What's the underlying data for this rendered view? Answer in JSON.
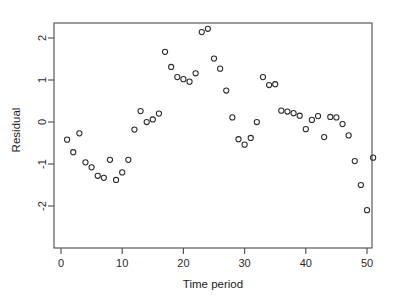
{
  "chart_data": {
    "type": "scatter",
    "title": "",
    "xlabel": "Time period",
    "ylabel": "Residual",
    "xlim": [
      -1.2,
      53.5
    ],
    "ylim": [
      -2.45,
      2.45
    ],
    "xticks": [
      0,
      10,
      20,
      30,
      40,
      50
    ],
    "yticks": [
      -2,
      -1,
      0,
      1,
      2
    ],
    "xtick_labels": [
      "0",
      "10",
      "20",
      "30",
      "40",
      "50"
    ],
    "ytick_labels": [
      "-2",
      "-1",
      "0",
      "1",
      "2"
    ],
    "grid": false,
    "legend": null,
    "marker": "open-circle",
    "marker_color": "#2b2b2b",
    "x": [
      1,
      2,
      3,
      4,
      5,
      6,
      7,
      8,
      9,
      10,
      11,
      12,
      13,
      14,
      15,
      16,
      17,
      18,
      19,
      20,
      21,
      22,
      23,
      24,
      25,
      26,
      27,
      28,
      29,
      30,
      31,
      32,
      33,
      34,
      35,
      36,
      37,
      38,
      39,
      40,
      41,
      42,
      43,
      44,
      45,
      46,
      47,
      48,
      49,
      50,
      51
    ],
    "y": [
      -0.42,
      -0.72,
      -0.27,
      -0.96,
      -1.08,
      -1.28,
      -1.33,
      -0.9,
      -1.38,
      -1.2,
      -0.9,
      -0.18,
      0.26,
      0.0,
      0.06,
      0.2,
      1.67,
      1.31,
      1.07,
      1.02,
      0.96,
      1.16,
      2.14,
      2.22,
      1.51,
      1.27,
      0.75,
      0.11,
      -0.41,
      -0.54,
      -0.38,
      0.0,
      1.07,
      0.88,
      0.9,
      0.27,
      0.25,
      0.21,
      0.15,
      -0.17,
      0.05,
      0.14,
      -0.36,
      0.12,
      0.11,
      -0.05,
      -0.32,
      -0.93,
      -1.5,
      -2.1,
      -0.85
    ],
    "axes_frame": {
      "left": 54,
      "right": 372,
      "top": 23,
      "bottom": 248
    },
    "pixel_mapping": {
      "x_origin_px": 61,
      "x_unit_px": 6.12,
      "y_origin_px": 122,
      "y_unit_px": 42
    },
    "points_count": 51
  },
  "figure": {
    "background": "#ffffff",
    "frame_color": "#4a4a4a",
    "text_color": "#1a1a1a"
  }
}
